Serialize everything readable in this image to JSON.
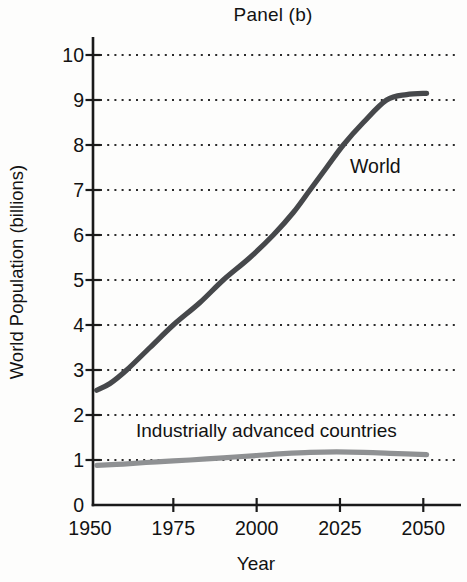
{
  "figure": {
    "title": "Panel (b)"
  },
  "chart_data": {
    "type": "line",
    "title": "Panel (b)",
    "xlabel": "Year",
    "ylabel": "World Population (billions)",
    "xlim": [
      1950,
      2060
    ],
    "ylim": [
      0,
      10.4
    ],
    "x_ticks": [
      1950,
      1975,
      2000,
      2025,
      2050
    ],
    "y_ticks": [
      0,
      1,
      2,
      3,
      4,
      5,
      6,
      7,
      8,
      9,
      10
    ],
    "grid": "horizontal dotted lines at each integer 1-10",
    "legend_position": "inline labels on chart",
    "series": [
      {
        "name": "World",
        "color": "#46484b",
        "points": [
          [
            1952,
            2.55
          ],
          [
            1956,
            2.7
          ],
          [
            1961,
            3.0
          ],
          [
            1968,
            3.5
          ],
          [
            1975,
            4.0
          ],
          [
            1983,
            4.5
          ],
          [
            1990,
            5.0
          ],
          [
            1998,
            5.5
          ],
          [
            2005,
            6.0
          ],
          [
            2011,
            6.5
          ],
          [
            2016,
            7.0
          ],
          [
            2021,
            7.5
          ],
          [
            2026,
            8.0
          ],
          [
            2032,
            8.5
          ],
          [
            2039,
            9.0
          ],
          [
            2045,
            9.12
          ],
          [
            2051,
            9.15
          ]
        ]
      },
      {
        "name": "Industrially advanced countries",
        "color": "#8f9193",
        "points": [
          [
            1952,
            0.88
          ],
          [
            1960,
            0.91
          ],
          [
            1970,
            0.96
          ],
          [
            1980,
            1.0
          ],
          [
            1990,
            1.05
          ],
          [
            2000,
            1.1
          ],
          [
            2008,
            1.14
          ],
          [
            2016,
            1.17
          ],
          [
            2024,
            1.18
          ],
          [
            2032,
            1.17
          ],
          [
            2040,
            1.15
          ],
          [
            2051,
            1.12
          ]
        ]
      }
    ],
    "annotations": [
      {
        "text": "World",
        "attached_to_series": "World"
      },
      {
        "text": "Industrially advanced countries",
        "attached_to_series": "Industrially advanced countries"
      }
    ]
  },
  "colors": {
    "axis": "#1a1a1a",
    "grid_dots": "#2b2b2b",
    "text": "#121212",
    "world_line": "#46484b",
    "advanced_line": "#8f9193",
    "background": "#fdfdfc"
  }
}
